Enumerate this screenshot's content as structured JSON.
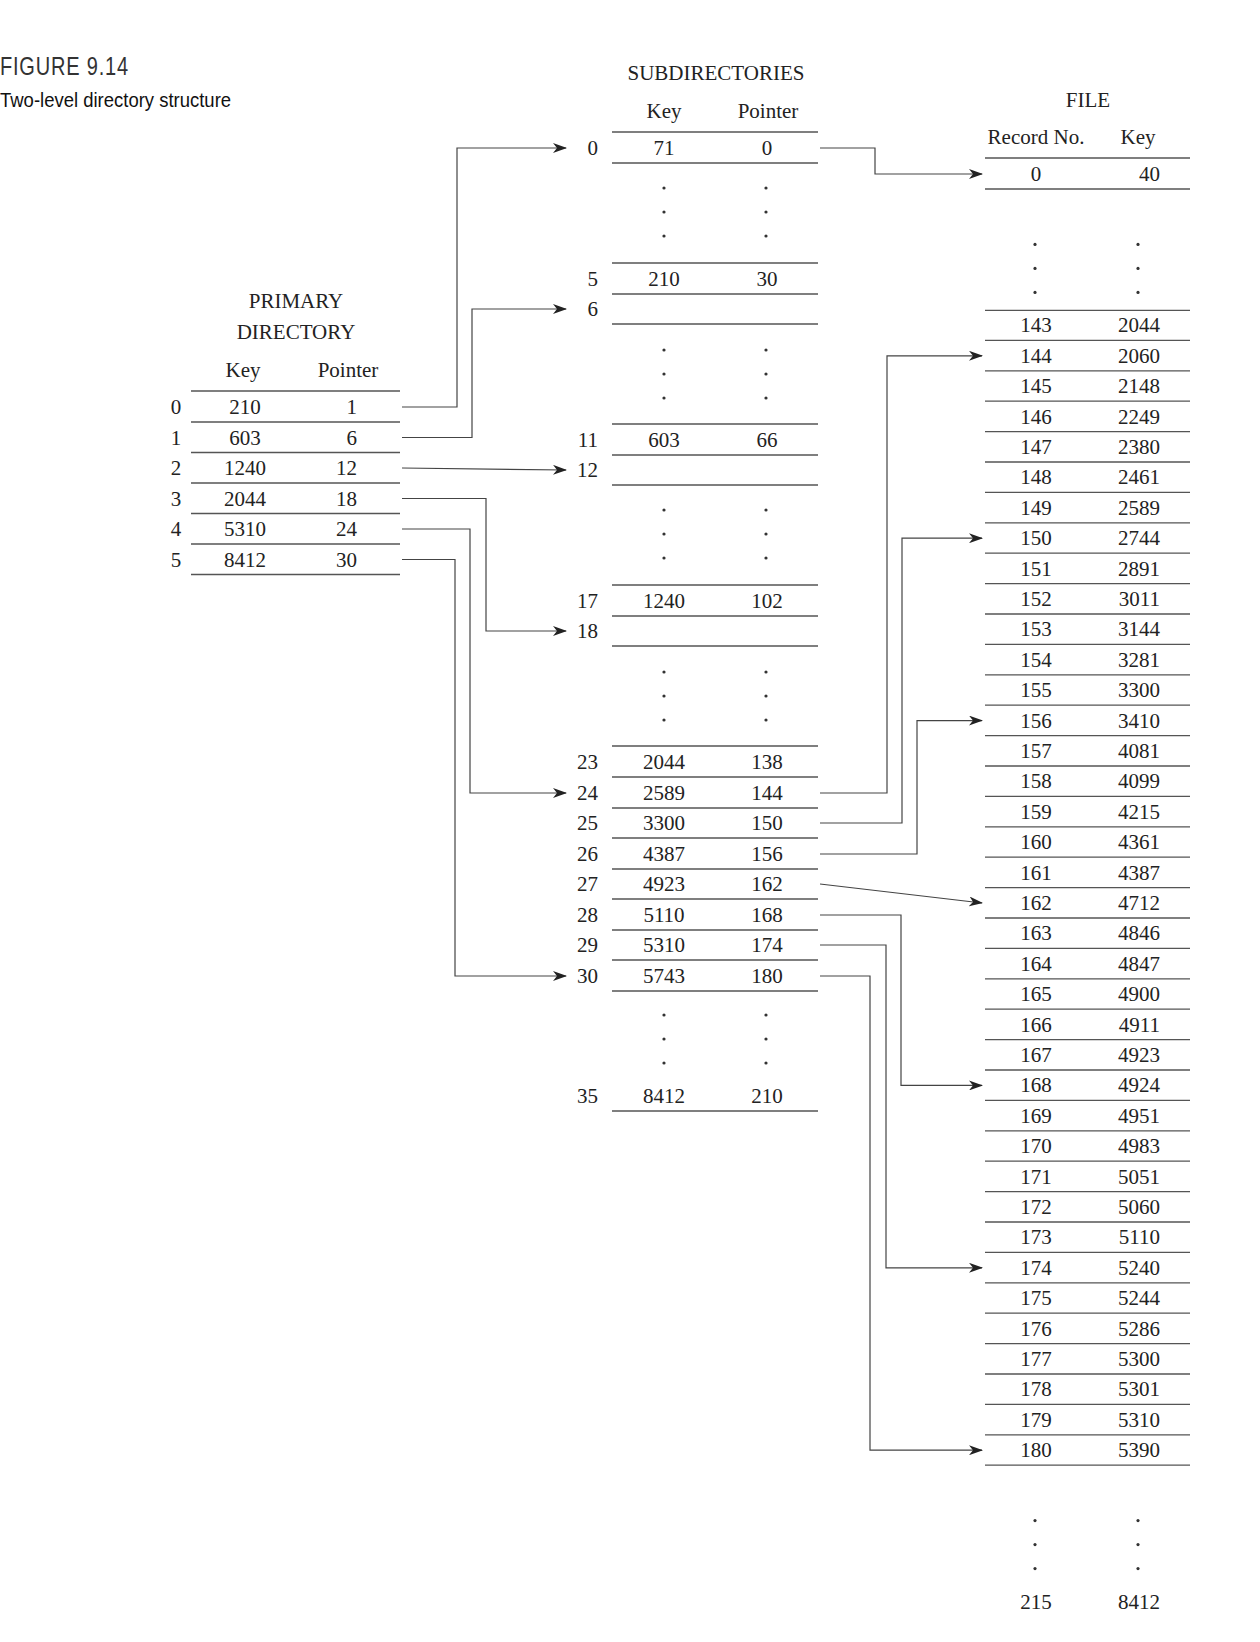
{
  "figure": {
    "label": "FIGURE 9.14",
    "caption": "Two-level directory structure"
  },
  "primary": {
    "title_line1": "PRIMARY",
    "title_line2": "DIRECTORY",
    "col_key": "Key",
    "col_pointer": "Pointer",
    "rows": [
      {
        "idx": "0",
        "key": "210",
        "ptr": "1"
      },
      {
        "idx": "1",
        "key": "603",
        "ptr": "6"
      },
      {
        "idx": "2",
        "key": "1240",
        "ptr": "12"
      },
      {
        "idx": "3",
        "key": "2044",
        "ptr": "18"
      },
      {
        "idx": "4",
        "key": "5310",
        "ptr": "24"
      },
      {
        "idx": "5",
        "key": "8412",
        "ptr": "30"
      }
    ]
  },
  "sub": {
    "title": "SUBDIRECTORIES",
    "col_key": "Key",
    "col_pointer": "Pointer",
    "rows": [
      {
        "idx": "0",
        "key": "71",
        "ptr": "0",
        "y": 148
      },
      {
        "gap": true,
        "y": 188
      },
      {
        "idx": "5",
        "key": "210",
        "ptr": "30",
        "y": 279
      },
      {
        "idx": "6",
        "key": "",
        "ptr": "",
        "y": 309
      },
      {
        "gap": true,
        "y": 350
      },
      {
        "idx": "11",
        "key": "603",
        "ptr": "66",
        "y": 440
      },
      {
        "idx": "12",
        "key": "",
        "ptr": "",
        "y": 470
      },
      {
        "gap": true,
        "y": 510
      },
      {
        "idx": "17",
        "key": "1240",
        "ptr": "102",
        "y": 601
      },
      {
        "idx": "18",
        "key": "",
        "ptr": "",
        "y": 631
      },
      {
        "gap": true,
        "y": 672
      },
      {
        "idx": "23",
        "key": "2044",
        "ptr": "138",
        "y": 762
      },
      {
        "idx": "24",
        "key": "2589",
        "ptr": "144",
        "y": 793
      },
      {
        "idx": "25",
        "key": "3300",
        "ptr": "150",
        "y": 823
      },
      {
        "idx": "26",
        "key": "4387",
        "ptr": "156",
        "y": 854
      },
      {
        "idx": "27",
        "key": "4923",
        "ptr": "162",
        "y": 884
      },
      {
        "idx": "28",
        "key": "5110",
        "ptr": "168",
        "y": 915
      },
      {
        "idx": "29",
        "key": "5310",
        "ptr": "174",
        "y": 945
      },
      {
        "idx": "30",
        "key": "5743",
        "ptr": "180",
        "y": 976
      },
      {
        "gap": true,
        "y": 1015
      },
      {
        "idx": "35",
        "key": "8412",
        "ptr": "210",
        "y": 1096,
        "norule_top": true
      }
    ]
  },
  "file": {
    "title": "FILE",
    "col_record": "Record No.",
    "col_key": "Key",
    "rows": [
      {
        "rec": "0",
        "key": "40"
      },
      {
        "gap": true
      },
      {
        "rec": "143",
        "key": "2044"
      },
      {
        "rec": "144",
        "key": "2060"
      },
      {
        "rec": "145",
        "key": "2148"
      },
      {
        "rec": "146",
        "key": "2249"
      },
      {
        "rec": "147",
        "key": "2380"
      },
      {
        "rec": "148",
        "key": "2461"
      },
      {
        "rec": "149",
        "key": "2589"
      },
      {
        "rec": "150",
        "key": "2744"
      },
      {
        "rec": "151",
        "key": "2891"
      },
      {
        "rec": "152",
        "key": "3011"
      },
      {
        "rec": "153",
        "key": "3144"
      },
      {
        "rec": "154",
        "key": "3281"
      },
      {
        "rec": "155",
        "key": "3300"
      },
      {
        "rec": "156",
        "key": "3410"
      },
      {
        "rec": "157",
        "key": "4081"
      },
      {
        "rec": "158",
        "key": "4099"
      },
      {
        "rec": "159",
        "key": "4215"
      },
      {
        "rec": "160",
        "key": "4361"
      },
      {
        "rec": "161",
        "key": "4387"
      },
      {
        "rec": "162",
        "key": "4712"
      },
      {
        "rec": "163",
        "key": "4846"
      },
      {
        "rec": "164",
        "key": "4847"
      },
      {
        "rec": "165",
        "key": "4900"
      },
      {
        "rec": "166",
        "key": "4911"
      },
      {
        "rec": "167",
        "key": "4923"
      },
      {
        "rec": "168",
        "key": "4924"
      },
      {
        "rec": "169",
        "key": "4951"
      },
      {
        "rec": "170",
        "key": "4983"
      },
      {
        "rec": "171",
        "key": "5051"
      },
      {
        "rec": "172",
        "key": "5060"
      },
      {
        "rec": "173",
        "key": "5110"
      },
      {
        "rec": "174",
        "key": "5240"
      },
      {
        "rec": "175",
        "key": "5244"
      },
      {
        "rec": "176",
        "key": "5286"
      },
      {
        "rec": "177",
        "key": "5300"
      },
      {
        "rec": "178",
        "key": "5301"
      },
      {
        "rec": "179",
        "key": "5310"
      },
      {
        "rec": "180",
        "key": "5390"
      },
      {
        "gap": true
      },
      {
        "rec": "215",
        "key": "8412",
        "last": true
      }
    ]
  },
  "links_primary_to_sub": [
    {
      "from": "0",
      "to": "0",
      "bend_x": 457
    },
    {
      "from": "1",
      "to": "6",
      "bend_x": 472
    },
    {
      "from": "2",
      "to": "12",
      "bend_x": null
    },
    {
      "from": "3",
      "to": "18",
      "bend_x": 486
    },
    {
      "from": "4",
      "to": "24",
      "bend_x": 470
    },
    {
      "from": "5",
      "to": "30",
      "bend_x": 455
    }
  ],
  "links_sub_to_file": [
    {
      "from": "0",
      "to": "0",
      "bend_x": 875
    },
    {
      "from": "24",
      "to": "144",
      "bend_x": 887
    },
    {
      "from": "25",
      "to": "150",
      "bend_x": 902
    },
    {
      "from": "26",
      "to": "156",
      "bend_x": 917
    },
    {
      "from": "27",
      "to": "162",
      "bend_x": null
    },
    {
      "from": "28",
      "to": "168",
      "bend_x": 901
    },
    {
      "from": "29",
      "to": "174",
      "bend_x": 886
    },
    {
      "from": "30",
      "to": "180",
      "bend_x": 870
    }
  ]
}
